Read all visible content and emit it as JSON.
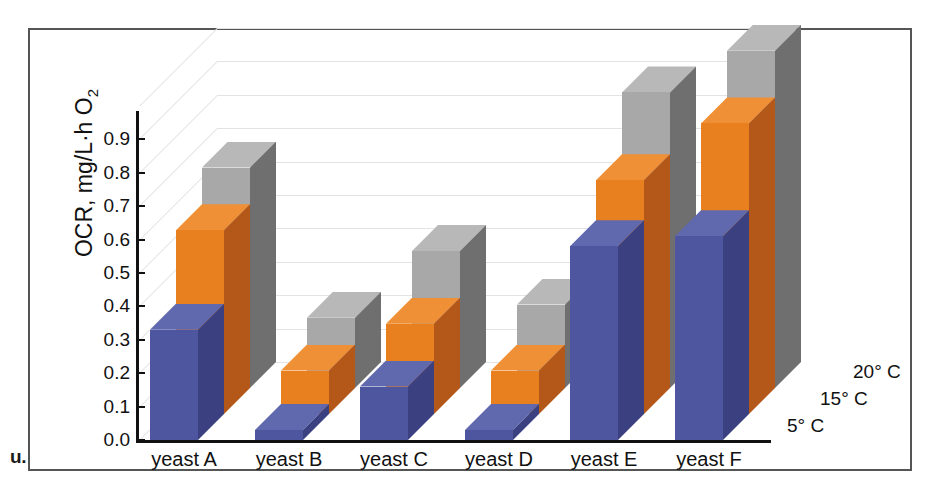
{
  "figure": {
    "caption_fragment": "u."
  },
  "chart_data": {
    "type": "bar",
    "title": "",
    "xlabel": "",
    "ylabel": "OCR, mg/L·h O",
    "ylabel_subscript": "2",
    "ylim": [
      0.0,
      1.0
    ],
    "ytick_labels": [
      "0.0",
      "0.1",
      "0.2",
      "0.3",
      "0.4",
      "0.5",
      "0.6",
      "0.7",
      "0.8",
      "0.9"
    ],
    "ytick_values": [
      0.0,
      0.1,
      0.2,
      0.3,
      0.4,
      0.5,
      0.6,
      0.7,
      0.8,
      0.9
    ],
    "categories": [
      "yeast A",
      "yeast B",
      "yeast C",
      "yeast D",
      "yeast E",
      "yeast F"
    ],
    "grid": true,
    "legend_position": "right-3d-depth-axis",
    "projection": "3d",
    "series": [
      {
        "name": "5° C",
        "color": "#4f56a0",
        "values": [
          0.33,
          0.03,
          0.16,
          0.03,
          0.58,
          0.61
        ]
      },
      {
        "name": "15° C",
        "color": "#e8801f",
        "values": [
          0.55,
          0.13,
          0.27,
          0.13,
          0.7,
          0.87
        ]
      },
      {
        "name": "20° C",
        "color": "#a8a8a8",
        "values": [
          0.66,
          0.21,
          0.41,
          0.25,
          0.885,
          1.01
        ]
      }
    ]
  },
  "colors": {
    "series_5c_front": "#4f56a0",
    "series_5c_top": "#6169ae",
    "series_5c_side": "#3b4180",
    "series_15c_front": "#e8801f",
    "series_15c_top": "#ef9036",
    "series_15c_side": "#b4581a",
    "series_20c_front": "#a8a8a8",
    "series_20c_top": "#b8b8b8",
    "series_20c_side": "#6f6f6f",
    "axis": "#111111",
    "gridline": "#e2e2e7",
    "frame": "#555555"
  }
}
